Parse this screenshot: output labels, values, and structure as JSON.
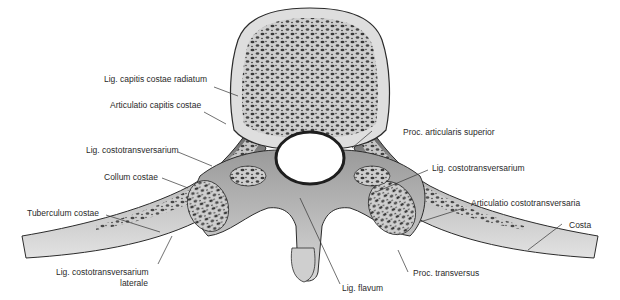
{
  "figure": {
    "palette": {
      "background": "#ffffff",
      "bone_light": "#dcdcdc",
      "bone_mid": "#b9b9b9",
      "bone_dark": "#6e6e6e",
      "spongy": "#3a3a3a",
      "outline": "#2b2b2b",
      "leader": "#333333",
      "text": "#2a2a2a"
    }
  },
  "labels": {
    "lig_capitis_costae_radiatum": "Lig. capitis costae radiatum",
    "articulatio_capitis_costae": "Articulatio capitis costae",
    "lig_costotransversarium_left": "Lig. costotransversarium",
    "collum_costae": "Collum costae",
    "tuberculum_costae": "Tuberculum costae",
    "lig_costotransversarium_laterale_1": "Lig. costotransversarium",
    "lig_costotransversarium_laterale_2": "laterale",
    "proc_articularis_superior": "Proc. articularis superior",
    "lig_costotransversarium_right": "Lig. costotransversarium",
    "articulatio_costotransversaria": "Articulatio costotransversaria",
    "costa": "Costa",
    "proc_transversus": "Proc. transversus",
    "lig_flavum": "Lig. flavum"
  }
}
